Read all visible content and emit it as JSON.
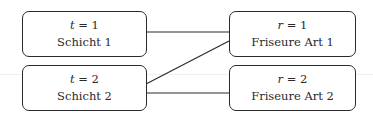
{
  "diagram": {
    "left_nodes": [
      {
        "var": "t",
        "eq": " = 1",
        "label": "Schicht 1"
      },
      {
        "var": "t",
        "eq": " = 2",
        "label": "Schicht 2"
      }
    ],
    "right_nodes": [
      {
        "var": "r",
        "eq": " = 1",
        "label": "Friseure Art 1"
      },
      {
        "var": "r",
        "eq": " = 2",
        "label": "Friseure Art 2"
      }
    ],
    "edges": [
      {
        "from": "t=1",
        "to": "r=1"
      },
      {
        "from": "t=2",
        "to": "r=1"
      },
      {
        "from": "t=2",
        "to": "r=2"
      }
    ],
    "colors": {
      "stroke": "#2b2b2b",
      "background": "#ffffff"
    }
  }
}
